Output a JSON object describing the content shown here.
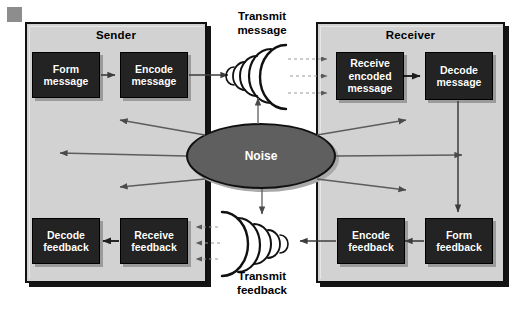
{
  "diagram": {
    "panels": [
      {
        "id": "sender",
        "label": "Sender"
      },
      {
        "id": "receiver",
        "label": "Receiver"
      }
    ],
    "sender_boxes": [
      {
        "id": "form-message",
        "lines": [
          "Form",
          "message"
        ]
      },
      {
        "id": "encode-message",
        "lines": [
          "Encode",
          "message"
        ]
      },
      {
        "id": "decode-feedback",
        "lines": [
          "Decode",
          "feedback"
        ]
      },
      {
        "id": "receive-feedback",
        "lines": [
          "Receive",
          "feedback"
        ]
      }
    ],
    "receiver_boxes": [
      {
        "id": "receive-encoded-message",
        "lines": [
          "Receive",
          "encoded",
          "message"
        ]
      },
      {
        "id": "decode-message",
        "lines": [
          "Decode",
          "message"
        ]
      },
      {
        "id": "encode-feedback",
        "lines": [
          "Encode",
          "feedback"
        ]
      },
      {
        "id": "form-feedback",
        "lines": [
          "Form",
          "feedback"
        ]
      }
    ],
    "center": {
      "id": "noise",
      "label": "Noise"
    },
    "channel_labels": [
      {
        "id": "transmit-message",
        "lines": [
          "Transmit",
          "message"
        ]
      },
      {
        "id": "transmit-feedback",
        "lines": [
          "Transmit",
          "feedback"
        ]
      }
    ],
    "colors": {
      "panel_fill": "#d2d2d2",
      "panel_border": "#111111",
      "box_fill": "#232323",
      "box_text": "#ffffff",
      "noise_fill": "#5f5f5f",
      "page_background": "#ffffff",
      "arrow": "#4a4a4a",
      "dashed": "#9a9a9a"
    }
  }
}
